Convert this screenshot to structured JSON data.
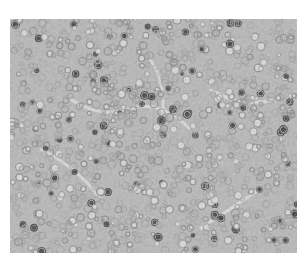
{
  "image": {
    "kind": "grayscale histology micrograph",
    "description": "Densely packed round cells with dark nuclei, lighter fibrous streaks",
    "colors": {
      "background": "#ffffff",
      "tissue_mid": "#b4b4b4",
      "cell_dark": "#4a4a4a",
      "cell_light": "#d8d8d8",
      "stroma": "#e6e6e6"
    }
  }
}
